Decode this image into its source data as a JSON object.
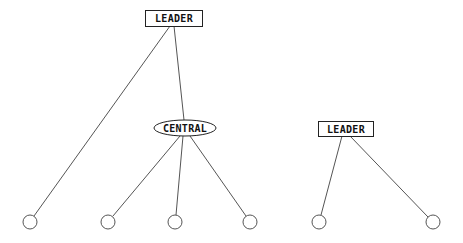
{
  "diagram": {
    "nodes": [
      {
        "id": "leader1",
        "label": "LEADER",
        "shape": "rect",
        "x": 145,
        "y": 10,
        "w": 57,
        "h": 16
      },
      {
        "id": "central",
        "label": "CENTRAL",
        "shape": "ellipse",
        "cx": 185,
        "cy": 128,
        "rx": 31,
        "ry": 8
      },
      {
        "id": "leader2",
        "label": "LEADER",
        "shape": "rect",
        "x": 318,
        "y": 121,
        "w": 55,
        "h": 15
      },
      {
        "id": "c1",
        "label": "",
        "shape": "circle",
        "cx": 30,
        "cy": 222,
        "r": 7
      },
      {
        "id": "c2",
        "label": "",
        "shape": "circle",
        "cx": 108,
        "cy": 222,
        "r": 7
      },
      {
        "id": "c3",
        "label": "",
        "shape": "circle",
        "cx": 175,
        "cy": 222,
        "r": 7
      },
      {
        "id": "c4",
        "label": "",
        "shape": "circle",
        "cx": 250,
        "cy": 222,
        "r": 7
      },
      {
        "id": "c5",
        "label": "",
        "shape": "circle",
        "cx": 319,
        "cy": 222,
        "r": 7
      },
      {
        "id": "c6",
        "label": "",
        "shape": "circle",
        "cx": 433,
        "cy": 222,
        "r": 7
      }
    ],
    "edges": [
      {
        "from": "leader1",
        "to": "c1"
      },
      {
        "from": "leader1",
        "to": "central"
      },
      {
        "from": "central",
        "to": "c2"
      },
      {
        "from": "central",
        "to": "c3"
      },
      {
        "from": "central",
        "to": "c4"
      },
      {
        "from": "leader2",
        "to": "c5"
      },
      {
        "from": "leader2",
        "to": "c6"
      }
    ],
    "labels": {
      "leader1": "LEADER",
      "central": "CENTRAL",
      "leader2": "LEADER"
    },
    "colors": {
      "line": "#555555",
      "stroke": "#222222",
      "background": "#ffffff"
    }
  }
}
